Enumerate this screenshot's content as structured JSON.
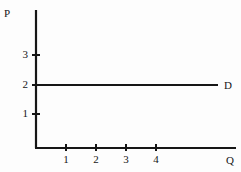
{
  "figure": {
    "background_color": "#fdfdfd",
    "ink_color": "#161616",
    "width": 241,
    "height": 172
  },
  "axes": {
    "y_axis": {
      "title": "P",
      "title_x": 4,
      "title_y": 8,
      "line_x": 36,
      "top_y": 10,
      "bottom_y": 148
    },
    "x_axis": {
      "title": "Q",
      "title_x": 226,
      "title_y": 155,
      "line_y": 148,
      "left_x": 36,
      "right_x": 236
    },
    "y_ticks": [
      {
        "label": "3",
        "value": 3,
        "y": 55
      },
      {
        "label": "2",
        "value": 2,
        "y": 85
      },
      {
        "label": "1",
        "value": 1,
        "y": 114
      }
    ],
    "x_ticks": [
      {
        "label": "1",
        "value": 1,
        "x": 66
      },
      {
        "label": "2",
        "value": 2,
        "x": 96
      },
      {
        "label": "3",
        "value": 3,
        "x": 126
      },
      {
        "label": "4",
        "value": 4,
        "x": 156
      }
    ]
  },
  "curve": {
    "label": "D",
    "label_x": 224,
    "label_y": 80,
    "price_level": 2,
    "y": 85,
    "start_x": 36,
    "end_x": 218
  },
  "chart_data": {
    "type": "line",
    "title": "",
    "xlabel": "Q",
    "ylabel": "P",
    "grid": false,
    "legend": "inline-right",
    "xlim": [
      0,
      5.2
    ],
    "ylim": [
      0,
      3.7
    ],
    "xticks": [
      1,
      2,
      3,
      4
    ],
    "yticks": [
      1,
      2,
      3
    ],
    "xticklabels": [
      "1",
      "2",
      "3",
      "4"
    ],
    "yticklabels": [
      "1",
      "2",
      "3"
    ],
    "series": [
      {
        "name": "D",
        "description": "perfectly elastic demand curve, horizontal at P = 2",
        "x": [
          0,
          6
        ],
        "y": [
          2,
          2
        ]
      }
    ],
    "annotations": [
      {
        "text": "D",
        "x": 6.1,
        "y": 2
      },
      {
        "text": "P",
        "x": 0,
        "y": 3.75
      },
      {
        "text": "Q",
        "x": 6.7,
        "y": 0
      }
    ]
  }
}
